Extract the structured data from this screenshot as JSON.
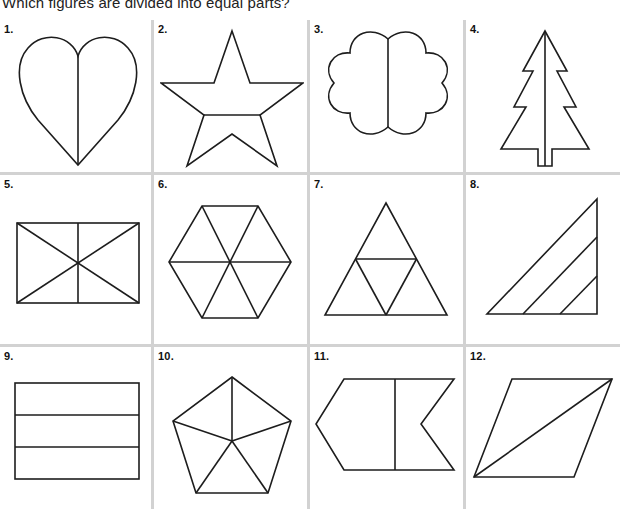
{
  "worksheet": {
    "title": "Which figures are divided into equal parts?",
    "columns": 4,
    "rows": 3,
    "rule_color": "#d2d2d2",
    "stroke_color": "#1d1d1d",
    "background_color": "#ffffff"
  },
  "figures": [
    {
      "number": "1.",
      "shape": "heart",
      "division": "vertical-line",
      "parts": 2,
      "equal_parts": true
    },
    {
      "number": "2.",
      "shape": "five-pointed-star",
      "division": "horizontal-line",
      "parts": 2,
      "equal_parts": false
    },
    {
      "number": "3.",
      "shape": "eight-lobe-flower",
      "division": "vertical-line",
      "parts": 2,
      "equal_parts": true
    },
    {
      "number": "4.",
      "shape": "christmas-tree",
      "division": "vertical-line",
      "parts": 2,
      "equal_parts": true
    },
    {
      "number": "5.",
      "shape": "rectangle",
      "division": "two-diagonals-and-vertical-midline",
      "parts": 6,
      "equal_parts": false
    },
    {
      "number": "6.",
      "shape": "regular-hexagon",
      "division": "three-main-diagonals",
      "parts": 6,
      "equal_parts": true
    },
    {
      "number": "7.",
      "shape": "triangle",
      "division": "midsegment-triangle",
      "parts": 4,
      "equal_parts": true
    },
    {
      "number": "8.",
      "shape": "right-triangle",
      "division": "two-lines-parallel-to-hypotenuse",
      "parts": 3,
      "equal_parts": false
    },
    {
      "number": "9.",
      "shape": "rectangle",
      "division": "two-horizontal-lines",
      "parts": 3,
      "equal_parts": true
    },
    {
      "number": "10.",
      "shape": "regular-pentagon",
      "division": "five-radii-from-interior-point",
      "parts": 5,
      "equal_parts": false
    },
    {
      "number": "11.",
      "shape": "arrow-chevron-hexagon",
      "division": "vertical-line",
      "parts": 2,
      "equal_parts": false
    },
    {
      "number": "12.",
      "shape": "parallelogram",
      "division": "diagonal",
      "parts": 2,
      "equal_parts": true
    }
  ]
}
